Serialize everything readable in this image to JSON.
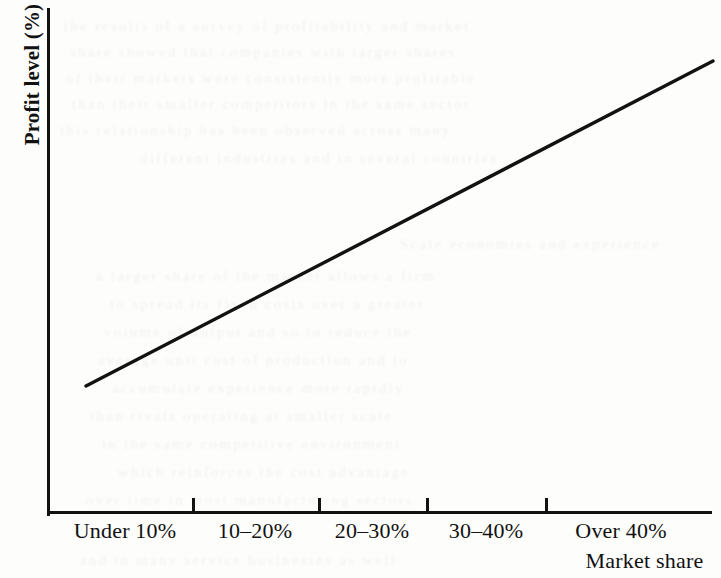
{
  "chart_data": {
    "type": "line",
    "title": "",
    "xlabel": "Market share",
    "ylabel": "Profit level (%)",
    "categories": [
      "Under 10%",
      "10–20%",
      "20–30%",
      "30–40%",
      "Over 40%"
    ],
    "series": [
      {
        "name": "Profit level",
        "values": [
          25,
          41,
          57,
          73,
          89
        ]
      }
    ],
    "ylim": [
      0,
      100
    ],
    "grid": false,
    "legend": null,
    "annotations": [],
    "line_color": "#121212",
    "axis_color": "#121212",
    "background_color": "#fdfdfc"
  },
  "axes": {
    "y_title": "Profit level (%)",
    "x_title": "Market share",
    "x_tick_labels": [
      {
        "label": "Under 10%",
        "center_x": 125
      },
      {
        "label": "10–20%",
        "center_x": 255
      },
      {
        "label": "20–30%",
        "center_x": 372
      },
      {
        "label": "30–40%",
        "center_x": 486
      },
      {
        "label": "Over 40%",
        "center_x": 620
      }
    ],
    "x_ticks_px": [
      192,
      318,
      426,
      545
    ]
  },
  "ghost_text": {
    "description": "faint ink show-through from the reverse side of the printed page",
    "lines": [
      {
        "text": "the results of a survey of profitability and market",
        "x": 64,
        "y": 18
      },
      {
        "text": "share showed that companies with larger shares",
        "x": 70,
        "y": 44
      },
      {
        "text": "of their markets were consistently more profitable",
        "x": 66,
        "y": 70
      },
      {
        "text": "than their smaller competitors in the same sector",
        "x": 72,
        "y": 96
      },
      {
        "text": "this relationship has been observed across many",
        "x": 60,
        "y": 122
      },
      {
        "text": "different industries and in several countries",
        "x": 140,
        "y": 150
      },
      {
        "text": "Scale economies and experience",
        "x": 400,
        "y": 236
      },
      {
        "text": "a larger share of the market allows a firm",
        "x": 96,
        "y": 268
      },
      {
        "text": "to spread its fixed costs over a greater",
        "x": 110,
        "y": 296
      },
      {
        "text": "volume of output and so to reduce the",
        "x": 104,
        "y": 324
      },
      {
        "text": "average unit cost of production and to",
        "x": 98,
        "y": 352
      },
      {
        "text": "accumulate experience more rapidly",
        "x": 112,
        "y": 380
      },
      {
        "text": "than rivals operating at smaller scale",
        "x": 90,
        "y": 408
      },
      {
        "text": "in the same competitive environment",
        "x": 102,
        "y": 436
      },
      {
        "text": "which reinforces the cost advantage",
        "x": 118,
        "y": 464
      },
      {
        "text": "over time in most manufacturing sectors",
        "x": 86,
        "y": 492
      },
      {
        "text": "and in many service businesses as well",
        "x": 80,
        "y": 552
      }
    ]
  }
}
